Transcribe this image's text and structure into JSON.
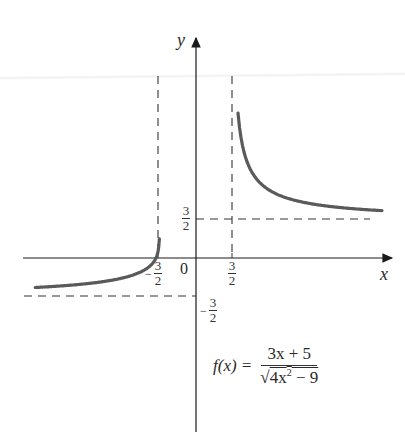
{
  "chart_data": {
    "type": "line",
    "title": "",
    "function": "f(x) = (3x + 5) / sqrt(4x^2 - 9)",
    "xlabel": "x",
    "ylabel": "y",
    "origin_label": "0",
    "x_ticks": [
      {
        "value": -1.5,
        "label": "-3/2"
      },
      {
        "value": 1.5,
        "label": "3/2"
      }
    ],
    "y_ticks": [
      {
        "value": 1.5,
        "label": "3/2"
      },
      {
        "value": -1.5,
        "label": "-3/2"
      }
    ],
    "asymptotes": {
      "vertical": [
        -1.5,
        1.5
      ],
      "horizontal": [
        1.5,
        -1.5
      ]
    },
    "series": [
      {
        "name": "left branch",
        "domain": [
          -6.7,
          -1.5
        ],
        "x": [
          -6.7,
          -6.0,
          -5.0,
          -4.0,
          -3.0,
          -2.5,
          -2.0,
          -1.8,
          -1.667,
          -1.6,
          -1.55,
          -1.52
        ],
        "values": [
          -0.77,
          -0.78,
          -0.83,
          -0.9,
          -0.77,
          -0.63,
          -0.38,
          -0.2,
          0.0,
          0.36,
          1.14,
          2.0
        ],
        "color": "#555555"
      },
      {
        "name": "right branch",
        "domain": [
          1.5,
          7.75
        ],
        "x": [
          1.6,
          1.7,
          1.8,
          2.0,
          2.5,
          3.0,
          4.0,
          5.0,
          6.0,
          7.0,
          7.75
        ],
        "values": [
          8.9,
          6.3,
          5.3,
          4.16,
          3.1,
          2.7,
          2.28,
          2.09,
          1.98,
          1.9,
          1.86
        ],
        "color": "#555555"
      }
    ],
    "xlim": [
      -7.2,
      8.0
    ],
    "ylim": [
      -6.7,
      8.7
    ],
    "grid": false,
    "legend": null
  },
  "labels": {
    "y_axis": "y",
    "x_axis": "x",
    "origin": "0",
    "three": "3",
    "two": "2",
    "minus": "−"
  },
  "formula": {
    "lhs": "f(x) =",
    "numerator": "3x + 5",
    "radical_sign": "√",
    "radicand_base": "4x",
    "radicand_exp": "2",
    "radicand_rest": " − 9"
  }
}
